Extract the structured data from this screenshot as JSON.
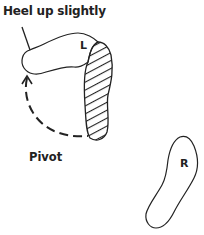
{
  "diagram": {
    "title": "Heel up slightly",
    "pivot_label": "Pivot",
    "left_foot_label": "L",
    "right_foot_label": "R",
    "colors": {
      "stroke": "#222222",
      "background": "#ffffff"
    }
  }
}
